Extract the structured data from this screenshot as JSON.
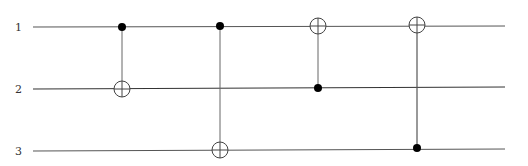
{
  "diagram": {
    "type": "quantum-circuit",
    "qubits": [
      {
        "label": "1",
        "y": 27
      },
      {
        "label": "2",
        "y": 89
      },
      {
        "label": "3",
        "y": 151
      }
    ],
    "gates": [
      {
        "type": "CNOT",
        "control": "1",
        "target": "2",
        "x": 122
      },
      {
        "type": "CNOT",
        "control": "1",
        "target": "3",
        "x": 220
      },
      {
        "type": "CNOT",
        "control": "2",
        "target": "1",
        "x": 318
      },
      {
        "type": "CNOT",
        "control": "3",
        "target": "1",
        "x": 417
      }
    ],
    "colors": {
      "wire": "#555555",
      "control": "#000000"
    }
  }
}
